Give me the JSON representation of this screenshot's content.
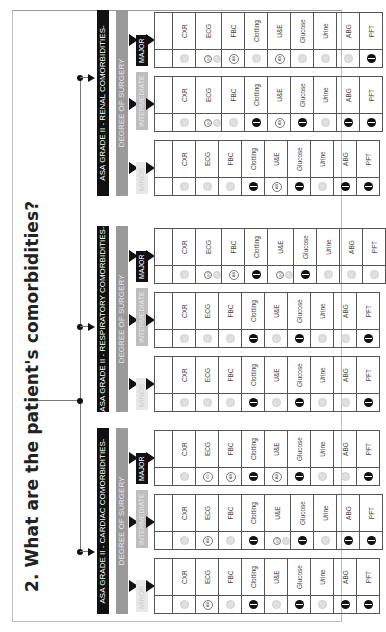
{
  "title": "2. What are the patient's comorbidities?",
  "tree": {
    "connector_color": "#777777",
    "node_color": "#111111"
  },
  "degree_label": "DEGREE OF SURGERY",
  "surgery_levels": [
    "MINOR",
    "INTERMEDIATE",
    "MAJOR"
  ],
  "test_labels": [
    "CXR",
    "ECG",
    "FBC",
    "Clotting",
    "U&E",
    "Glucose",
    "Urine",
    "ABG",
    "PFT"
  ],
  "legend_icons": {
    "grey": "not-indicated-icon (grey circle)",
    "black": "indicated-icon (black circle)",
    "ab": "age-based-icon (circled AB)",
    "bo": "based-on-history-icon (circled 60)"
  },
  "sections": [
    {
      "header": "ASA GRADE II - CARDIAC COMORBIDITIES-",
      "columns": [
        {
          "level": "MINOR",
          "icons": [
            "grey",
            "ab",
            "grey",
            "black",
            "grey",
            "black",
            "grey",
            "black",
            "black"
          ]
        },
        {
          "level": "INTERMEDIATE",
          "icons": [
            "grey",
            "ab",
            "grey",
            "black",
            "bo+grey",
            "black",
            "grey",
            "black",
            "black"
          ]
        },
        {
          "level": "MAJOR",
          "icons": [
            "grey",
            "bo",
            "ab",
            "black",
            "ab",
            "black",
            "grey",
            "grey",
            "black"
          ]
        }
      ]
    },
    {
      "header": "ASA GRADE II - RESPIRATORY COMORBIDITIES-",
      "columns": [
        {
          "level": "MINOR",
          "icons": [
            "grey",
            "grey",
            "grey",
            "black",
            "grey",
            "black",
            "grey",
            "grey",
            "black"
          ]
        },
        {
          "level": "INTERMEDIATE",
          "icons": [
            "grey",
            "grey",
            "grey",
            "black",
            "grey",
            "black",
            "grey",
            "grey",
            "black"
          ]
        },
        {
          "level": "MAJOR",
          "icons": [
            "grey",
            "bo+grey",
            "ab",
            "black",
            "bo+grey",
            "black",
            "grey",
            "grey",
            "grey"
          ]
        }
      ]
    },
    {
      "header": "ASA GRADE II - RENAL COMORBIDITIES-",
      "columns": [
        {
          "level": "MINOR",
          "icons": [
            "grey",
            "grey",
            "grey",
            "black",
            "ab",
            "black",
            "grey",
            "black",
            "black"
          ]
        },
        {
          "level": "INTERMEDIATE",
          "icons": [
            "grey",
            "bo+grey",
            "grey",
            "black",
            "ab",
            "black",
            "grey",
            "black",
            "black"
          ]
        },
        {
          "level": "MAJOR",
          "icons": [
            "grey",
            "bo+grey",
            "ab",
            "grey",
            "ab",
            "grey",
            "grey",
            "grey",
            "black"
          ]
        }
      ]
    }
  ],
  "icon_text": {
    "ab": "AB",
    "bo": "60"
  }
}
